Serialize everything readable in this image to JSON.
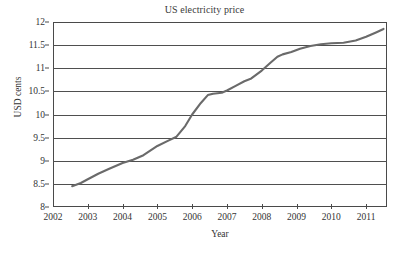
{
  "chart_data": {
    "type": "line",
    "title": "US electricity price",
    "xlabel": "Year",
    "ylabel": "USD cents",
    "xlim": [
      2002,
      2011.6
    ],
    "ylim": [
      8,
      12
    ],
    "grid": "horizontal",
    "legend": "none",
    "line_color": "#6a6a6a",
    "x_ticks": [
      2002,
      2003,
      2004,
      2005,
      2006,
      2007,
      2008,
      2009,
      2010,
      2011
    ],
    "x_ticklabels": [
      "2002",
      "2003",
      "2004",
      "2005",
      "2006",
      "2007",
      "2008",
      "2009",
      "2010",
      "2011"
    ],
    "y_ticks": [
      8,
      8.5,
      9,
      9.5,
      10,
      10.5,
      11,
      11.5,
      12
    ],
    "y_ticklabels": [
      "8",
      "8.5",
      "9",
      "9.5",
      "10",
      "10.5",
      "11",
      "11.5",
      "12"
    ],
    "series": [
      {
        "name": "US electricity price",
        "x": [
          2002.55,
          2002.8,
          2003.0,
          2003.3,
          2003.6,
          2004.0,
          2004.3,
          2004.6,
          2005.0,
          2005.3,
          2005.55,
          2005.8,
          2006.0,
          2006.25,
          2006.45,
          2006.6,
          2006.85,
          2007.0,
          2007.25,
          2007.5,
          2007.7,
          2008.0,
          2008.25,
          2008.45,
          2008.6,
          2008.85,
          2009.1,
          2009.4,
          2009.7,
          2010.0,
          2010.35,
          2010.7,
          2011.0,
          2011.3,
          2011.5
        ],
        "y": [
          8.45,
          8.52,
          8.6,
          8.72,
          8.82,
          8.95,
          9.02,
          9.12,
          9.32,
          9.43,
          9.52,
          9.75,
          10.0,
          10.25,
          10.42,
          10.45,
          10.47,
          10.52,
          10.62,
          10.72,
          10.78,
          10.95,
          11.12,
          11.25,
          11.3,
          11.35,
          11.42,
          11.48,
          11.52,
          11.54,
          11.55,
          11.6,
          11.68,
          11.78,
          11.85
        ]
      }
    ]
  }
}
